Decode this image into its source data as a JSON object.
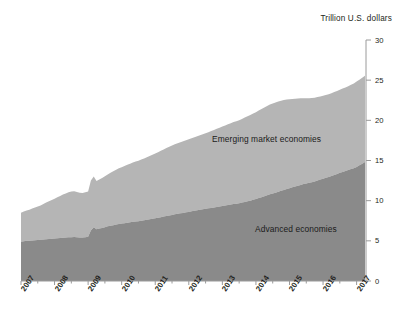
{
  "chart_data": {
    "type": "area",
    "stacked": true,
    "title": "",
    "axis_note": "Trillion U.S. dollars",
    "xlabel": "",
    "ylabel": "Trillion U.S. dollars",
    "xlim": [
      2007.0,
      2017.25
    ],
    "ylim": [
      0,
      30
    ],
    "yticks": [
      0,
      5,
      10,
      15,
      20,
      25,
      30
    ],
    "ytick_labels": [
      "0",
      "5",
      "10",
      "15",
      "20",
      "25",
      "30"
    ],
    "xticks": [
      2007,
      2008,
      2009,
      2010,
      2011,
      2012,
      2013,
      2014,
      2015,
      2016,
      2017
    ],
    "xtick_labels": [
      "2007",
      "2008",
      "2009",
      "2010",
      "2011",
      "2012",
      "2013",
      "2014",
      "2015",
      "2016",
      "2017"
    ],
    "minor_xticks_per_interval": 2,
    "grid": false,
    "legend_position": "inline-annotation",
    "colors": {
      "advanced": "#8a8a8a",
      "emerging": "#b5b5b5",
      "axis": "#9a9a9a",
      "text": "#231f20",
      "background": "#ffffff"
    },
    "x": [
      2007.0,
      2007.083,
      2007.167,
      2007.25,
      2007.333,
      2007.417,
      2007.5,
      2007.583,
      2007.667,
      2007.75,
      2007.833,
      2007.917,
      2008.0,
      2008.083,
      2008.167,
      2008.25,
      2008.333,
      2008.417,
      2008.5,
      2008.583,
      2008.667,
      2008.75,
      2008.833,
      2008.917,
      2009.0,
      2009.083,
      2009.167,
      2009.25,
      2009.333,
      2009.417,
      2009.5,
      2009.583,
      2009.667,
      2009.75,
      2009.833,
      2009.917,
      2010.0,
      2010.083,
      2010.167,
      2010.25,
      2010.333,
      2010.417,
      2010.5,
      2010.583,
      2010.667,
      2010.75,
      2010.833,
      2010.917,
      2011.0,
      2011.083,
      2011.167,
      2011.25,
      2011.333,
      2011.417,
      2011.5,
      2011.583,
      2011.667,
      2011.75,
      2011.833,
      2011.917,
      2012.0,
      2012.083,
      2012.167,
      2012.25,
      2012.333,
      2012.417,
      2012.5,
      2012.583,
      2012.667,
      2012.75,
      2012.833,
      2012.917,
      2013.0,
      2013.083,
      2013.167,
      2013.25,
      2013.333,
      2013.417,
      2013.5,
      2013.583,
      2013.667,
      2013.75,
      2013.833,
      2013.917,
      2014.0,
      2014.083,
      2014.167,
      2014.25,
      2014.333,
      2014.417,
      2014.5,
      2014.583,
      2014.667,
      2014.75,
      2014.833,
      2014.917,
      2015.0,
      2015.083,
      2015.167,
      2015.25,
      2015.333,
      2015.417,
      2015.5,
      2015.583,
      2015.667,
      2015.75,
      2015.833,
      2015.917,
      2016.0,
      2016.083,
      2016.167,
      2016.25,
      2016.333,
      2016.417,
      2016.5,
      2016.583,
      2016.667,
      2016.75,
      2016.833,
      2016.917,
      2017.0,
      2017.083,
      2017.167,
      2017.25
    ],
    "series": [
      {
        "name": "Advanced economies",
        "color": "#8a8a8a",
        "values": [
          4.9,
          4.95,
          5.0,
          5.02,
          5.05,
          5.08,
          5.1,
          5.12,
          5.16,
          5.2,
          5.22,
          5.25,
          5.28,
          5.32,
          5.35,
          5.38,
          5.4,
          5.44,
          5.46,
          5.48,
          5.45,
          5.42,
          5.4,
          5.44,
          5.5,
          6.3,
          6.7,
          6.45,
          6.55,
          6.6,
          6.7,
          6.8,
          6.88,
          6.95,
          7.02,
          7.1,
          7.15,
          7.2,
          7.26,
          7.3,
          7.36,
          7.4,
          7.44,
          7.5,
          7.55,
          7.62,
          7.68,
          7.75,
          7.8,
          7.88,
          7.95,
          8.02,
          8.1,
          8.16,
          8.22,
          8.3,
          8.36,
          8.42,
          8.48,
          8.55,
          8.6,
          8.68,
          8.74,
          8.8,
          8.86,
          8.92,
          8.98,
          9.05,
          9.1,
          9.16,
          9.22,
          9.28,
          9.34,
          9.4,
          9.46,
          9.52,
          9.58,
          9.62,
          9.68,
          9.76,
          9.84,
          9.92,
          10.0,
          10.1,
          10.2,
          10.32,
          10.44,
          10.56,
          10.68,
          10.8,
          10.9,
          11.0,
          11.1,
          11.22,
          11.34,
          11.46,
          11.56,
          11.66,
          11.76,
          11.86,
          11.96,
          12.06,
          12.14,
          12.22,
          12.3,
          12.4,
          12.52,
          12.62,
          12.72,
          12.84,
          12.96,
          13.08,
          13.2,
          13.32,
          13.46,
          13.58,
          13.7,
          13.82,
          13.94,
          14.05,
          14.2,
          14.4,
          14.6,
          14.8
        ]
      },
      {
        "name": "Emerging market economies",
        "color": "#b5b5b5",
        "values": [
          3.6,
          3.7,
          3.78,
          3.86,
          3.96,
          4.06,
          4.16,
          4.28,
          4.42,
          4.56,
          4.7,
          4.82,
          4.96,
          5.1,
          5.24,
          5.38,
          5.48,
          5.6,
          5.68,
          5.7,
          5.62,
          5.58,
          5.56,
          5.6,
          5.64,
          6.2,
          6.3,
          6.0,
          6.1,
          6.22,
          6.34,
          6.46,
          6.58,
          6.7,
          6.82,
          6.92,
          7.02,
          7.12,
          7.22,
          7.3,
          7.38,
          7.46,
          7.54,
          7.62,
          7.7,
          7.8,
          7.88,
          7.96,
          8.06,
          8.16,
          8.26,
          8.36,
          8.46,
          8.56,
          8.64,
          8.72,
          8.8,
          8.86,
          8.92,
          8.98,
          9.04,
          9.1,
          9.16,
          9.22,
          9.28,
          9.34,
          9.4,
          9.48,
          9.56,
          9.64,
          9.72,
          9.8,
          9.88,
          9.96,
          10.04,
          10.12,
          10.2,
          10.28,
          10.34,
          10.42,
          10.5,
          10.58,
          10.66,
          10.74,
          10.82,
          10.9,
          10.98,
          11.04,
          11.1,
          11.16,
          11.2,
          11.22,
          11.24,
          11.22,
          11.18,
          11.12,
          11.06,
          11.0,
          10.94,
          10.86,
          10.78,
          10.7,
          10.62,
          10.54,
          10.48,
          10.42,
          10.38,
          10.36,
          10.34,
          10.32,
          10.3,
          10.3,
          10.32,
          10.34,
          10.36,
          10.38,
          10.4,
          10.42,
          10.48,
          10.55,
          10.62,
          10.66,
          10.7,
          10.75
        ]
      }
    ],
    "totals_note": {
      "start_total": 8.5,
      "end_total": 25.55,
      "peak_2014_total": 22.7
    },
    "annotations": [
      {
        "text": "Emerging market economies",
        "x": 2013.1,
        "y": 17.3
      },
      {
        "text": "Advanced economies",
        "x": 2014.3,
        "y": 6.9
      }
    ]
  }
}
